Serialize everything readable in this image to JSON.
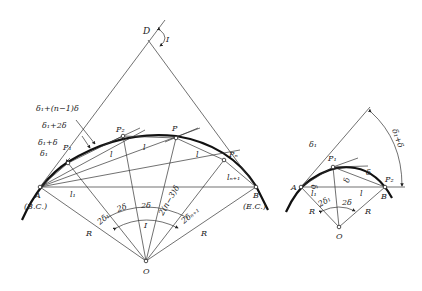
{
  "figure_left": {
    "labels": {
      "D": "D",
      "I_top": "I",
      "d1_n1": "δ₁+(n−1)δ",
      "d1_2d": "δ₁+2δ",
      "d1_d": "δ₁+δ",
      "d1": "δ₁",
      "P1": "P₁",
      "P2": "P₂",
      "P": "P",
      "Pn": "Pₙ",
      "l_a": "l",
      "l_b": "l",
      "l_c": "l",
      "l1": "l₁",
      "ln1": "lₙ₊₁",
      "A": "A",
      "BC": "(B.C.)",
      "B": "B",
      "EC": "(E.C.)",
      "R_left": "R",
      "R_right": "R",
      "O": "O",
      "a_2d1": "2δ₁",
      "a_2d_1": "2δ",
      "a_2d_2": "2δ",
      "a_2n3": "2(n−3)δ",
      "a_2dn1": "2δₙ₊₁",
      "I_center": "I"
    }
  },
  "figure_right": {
    "labels": {
      "d1": "δ₁",
      "d1_d": "δ₁+δ",
      "P1": "P₁",
      "d": "δ",
      "A": "A",
      "P2": "P₂",
      "B": "B",
      "delta_a": "δ",
      "delta_b": "δ",
      "l1": "l₁",
      "l": "l",
      "a_2d1": "2δ₁",
      "a_2d": "2δ",
      "R_left": "R",
      "R_right": "R",
      "O": "O"
    }
  }
}
